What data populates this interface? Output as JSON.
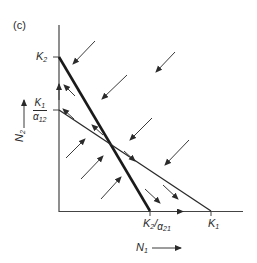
{
  "figure": {
    "panel_label": "(c)",
    "axes": {
      "x_label": "N",
      "x_label_sub": "1",
      "y_label": "N",
      "y_label_sub": "2"
    },
    "y_ticks": [
      {
        "id": "K2",
        "main": "K",
        "sub": "2"
      },
      {
        "id": "K1_over_alpha12",
        "num": "K",
        "num_sub": "1",
        "den": "α",
        "den_sub": "12"
      }
    ],
    "x_ticks": [
      {
        "id": "K2_over_alpha21",
        "main": "K",
        "sub": "2",
        "slash": "/",
        "den": "α",
        "den_sub": "21"
      },
      {
        "id": "K1",
        "main": "K",
        "sub": "1"
      }
    ],
    "isoclines": [
      {
        "name": "N2 isocline",
        "from": "K2 on N2 axis",
        "to": "K2/α21 on N1 axis",
        "weight": "thick"
      },
      {
        "name": "N1 isocline",
        "from": "K1/α12 on N2 axis",
        "to": "K1 on N1 axis",
        "weight": "thin"
      }
    ],
    "colors": {
      "ink": "#2a2a2a",
      "background": "#ffffff"
    }
  }
}
